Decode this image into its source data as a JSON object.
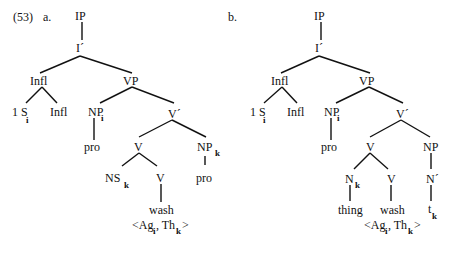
{
  "example_number": "(53)",
  "trees": [
    {
      "label": "a.",
      "nodes": {
        "ip": "IP",
        "ibar": "I´",
        "infl": "Infl",
        "s_main": "1 S",
        "s_sub": "i",
        "infl2": "Infl",
        "vp": "VP",
        "np_main": "NP",
        "np_sub": "i",
        "pro1": "pro",
        "vbar": "V´",
        "v": "V",
        "np2_main": "NP",
        "np2_sub": "k",
        "ns_main": "NS",
        "ns_sub": "k",
        "v2": "V",
        "pro2": "pro",
        "wash": "wash",
        "grid_open": "<Ag",
        "grid_i": "i",
        "grid_mid": ", Th",
        "grid_k": "k",
        "grid_close": ">"
      }
    },
    {
      "label": "b.",
      "nodes": {
        "ip": "IP",
        "ibar": "I´",
        "infl": "Infl",
        "s_main": "1 S",
        "s_sub": "i",
        "infl2": "Infl",
        "vp": "VP",
        "np_main": "NP",
        "np_sub": "i",
        "pro1": "pro",
        "vbar": "V´",
        "v": "V",
        "np2": "NP",
        "n_main": "N",
        "n_sub": "k",
        "v2": "V",
        "nbar": "N´",
        "thing": "thing",
        "wash": "wash",
        "t_main": "t",
        "t_sub": "k",
        "grid_open": "<Ag",
        "grid_i": "i",
        "grid_mid": ", Th",
        "grid_k": "k",
        "grid_close": ">"
      }
    }
  ]
}
